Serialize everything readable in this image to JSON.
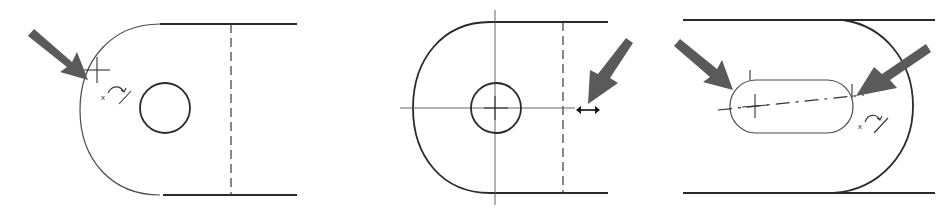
{
  "figure": {
    "colors": {
      "background": "#ffffff",
      "line": "#2a2a2a",
      "arrow": "#5a5a5a"
    },
    "panels": [
      {
        "id": "panel-1",
        "shape": "rounded-end plate with hole",
        "cursor_glyph": "x",
        "callout": "arrow pointing to point on arc"
      },
      {
        "id": "panel-2",
        "shape": "rounded-end plate with hole and centerlines",
        "callout": "arrow pointing to horizontal dimension handle"
      },
      {
        "id": "panel-3",
        "shape": "plate with slot",
        "cursor_glyph": "x",
        "callout": "two arrows pointing to slot ends"
      }
    ]
  }
}
